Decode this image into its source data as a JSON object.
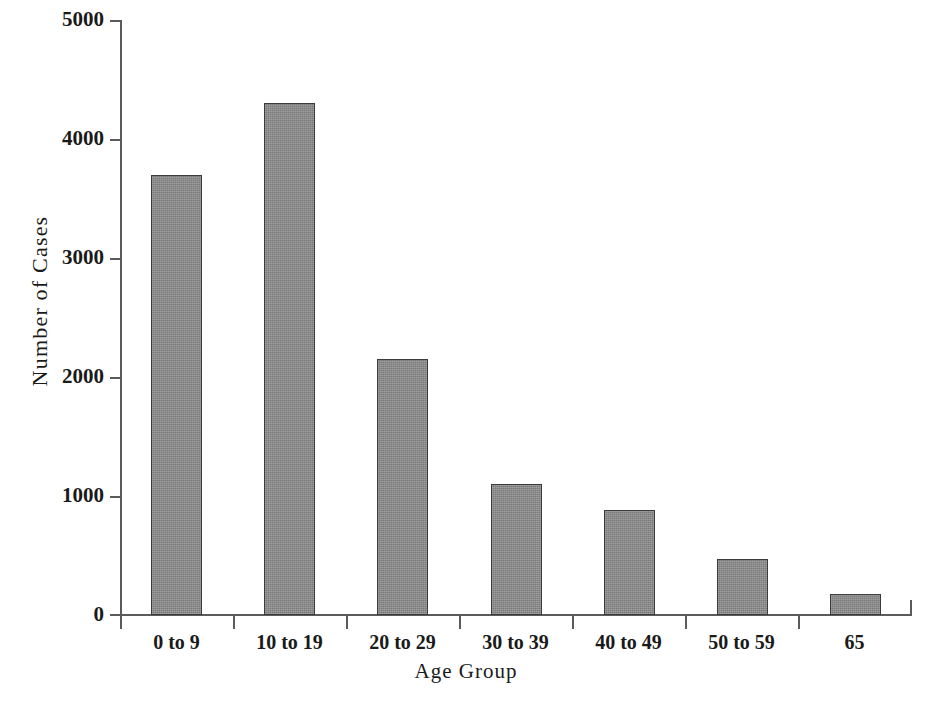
{
  "chart_data": {
    "type": "bar",
    "title": "",
    "subtitle": "",
    "xlabel": "Age Group",
    "ylabel": "Number of Cases",
    "categories": [
      "0 to 9",
      "10 to 19",
      "20 to 29",
      "30 to 39",
      "40 to 49",
      "50 to 59",
      "65"
    ],
    "values": [
      3700,
      4300,
      2150,
      1100,
      880,
      470,
      175
    ],
    "ylim": [
      0,
      5000
    ],
    "yticks": [
      0,
      1000,
      2000,
      3000,
      4000,
      5000
    ],
    "ytick_labels": [
      "0",
      "1000",
      "2000",
      "3000",
      "4000",
      "5000"
    ],
    "grid": false,
    "legend": false,
    "legend_position": "none",
    "bar_fill_color": "#8a8a8a",
    "bar_edge_color": "#3b3b3b",
    "axis_color": "#5b5b5b",
    "background_color": "#ffffff",
    "annotations": []
  }
}
